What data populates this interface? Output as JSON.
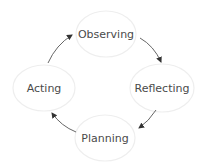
{
  "diagram": {
    "type": "cycle",
    "colors": {
      "node_border": "#eeeeee",
      "text": "#4a4a4a",
      "arrow": "#333333",
      "background": "#ffffff"
    },
    "nodes": [
      {
        "id": "observing",
        "label": "Observing"
      },
      {
        "id": "reflecting",
        "label": "Reflecting"
      },
      {
        "id": "planning",
        "label": "Planning"
      },
      {
        "id": "acting",
        "label": "Acting"
      }
    ],
    "edges": [
      {
        "from": "observing",
        "to": "reflecting"
      },
      {
        "from": "reflecting",
        "to": "planning"
      },
      {
        "from": "planning",
        "to": "acting"
      },
      {
        "from": "acting",
        "to": "observing"
      }
    ]
  }
}
